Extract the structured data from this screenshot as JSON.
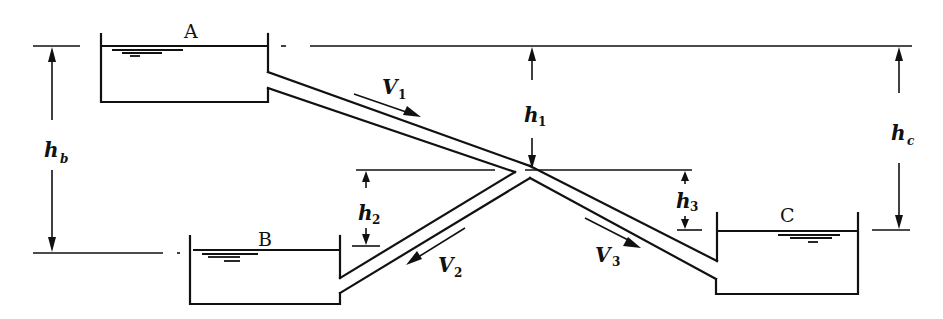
{
  "diagram": {
    "reservoirs": [
      {
        "id": "A",
        "label": "A"
      },
      {
        "id": "B",
        "label": "B"
      },
      {
        "id": "C",
        "label": "C"
      }
    ],
    "velocities": [
      {
        "id": "V1",
        "symbol": "V",
        "subscript": "1"
      },
      {
        "id": "V2",
        "symbol": "V",
        "subscript": "2"
      },
      {
        "id": "V3",
        "symbol": "V",
        "subscript": "3"
      }
    ],
    "heads": [
      {
        "id": "h1",
        "symbol": "h",
        "subscript": "1"
      },
      {
        "id": "h2",
        "symbol": "h",
        "subscript": "2"
      },
      {
        "id": "h3",
        "symbol": "h",
        "subscript": "3"
      },
      {
        "id": "hb",
        "symbol": "h",
        "subscript": "b"
      },
      {
        "id": "hc",
        "symbol": "h",
        "subscript": "c"
      }
    ],
    "line_color": "#111111",
    "background": "#ffffff"
  }
}
